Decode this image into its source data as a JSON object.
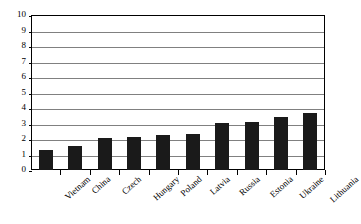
{
  "chart_data": {
    "type": "bar",
    "title": "",
    "subtitle": "",
    "xlabel": "",
    "ylabel": "",
    "categories": [
      "Vietnam",
      "China",
      "Czech",
      "Hungary",
      "Poland",
      "Latvia",
      "Russia",
      "Estonia",
      "Ukraine",
      "Lithuania"
    ],
    "values": [
      1.3,
      1.55,
      2.05,
      2.1,
      2.25,
      2.35,
      3.05,
      3.1,
      3.4,
      3.7
    ],
    "series": [
      {
        "name": "",
        "values": [
          1.3,
          1.55,
          2.05,
          2.1,
          2.25,
          2.35,
          3.05,
          3.1,
          3.4,
          3.7
        ]
      }
    ],
    "ylim": [
      0,
      10
    ],
    "ytick_labels": [
      "10",
      "9",
      "8",
      "7",
      "6",
      "5",
      "4",
      "3",
      "2",
      "1",
      "0"
    ],
    "ytick_values": [
      10,
      9,
      8,
      7,
      6,
      5,
      4,
      3,
      2,
      1,
      0
    ],
    "grid": true,
    "grid_axis": "y",
    "legend": false,
    "legend_position": "none",
    "annotations": [],
    "colors": {
      "bar": "#1a1a1a",
      "grid": "#808080",
      "axis": "#000000",
      "background": "#ffffff",
      "text": "#000000"
    }
  }
}
